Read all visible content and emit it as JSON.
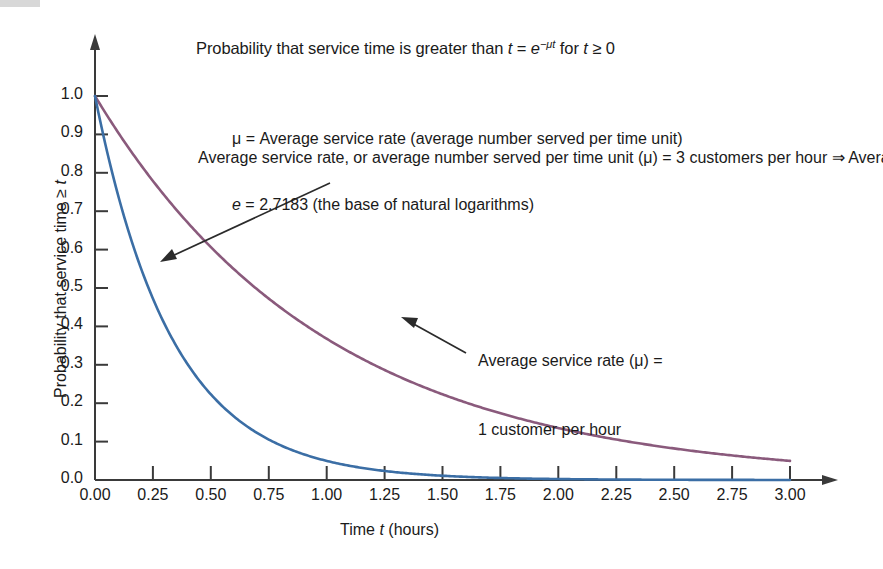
{
  "chart_data": {
    "type": "line",
    "title_parts": {
      "lead": "Probability that service time is greater than ",
      "var_t": "t",
      "equals": " = ",
      "base_e": "e",
      "exponent": "−μt",
      "tail_for": " for ",
      "var_t2": "t",
      "tail_cond": " ≥ 0"
    },
    "xlabel": "Time t (hours)",
    "xlabel_parts": {
      "lead": "Time ",
      "var": "t",
      "tail": " (hours)"
    },
    "ylabel": "Probability that service time ≥ t",
    "ylabel_parts": {
      "lead": "Probability that service time ≥ ",
      "var": "t"
    },
    "xlim": [
      0,
      3
    ],
    "ylim": [
      0,
      1
    ],
    "grid": false,
    "legend": "none",
    "xticks": [
      "0.00",
      "0.25",
      "0.50",
      "0.75",
      "1.00",
      "1.25",
      "1.50",
      "1.75",
      "2.00",
      "2.25",
      "2.50",
      "2.75",
      "3.00"
    ],
    "xtick_values": [
      0,
      0.25,
      0.5,
      0.75,
      1,
      1.25,
      1.5,
      1.75,
      2,
      2.25,
      2.5,
      2.75,
      3
    ],
    "yticks": [
      "0.0",
      "0.1",
      "0.2",
      "0.3",
      "0.4",
      "0.5",
      "0.6",
      "0.7",
      "0.8",
      "0.9",
      "1.0"
    ],
    "ytick_values": [
      0,
      0.1,
      0.2,
      0.3,
      0.4,
      0.5,
      0.6,
      0.7,
      0.8,
      0.9,
      1.0
    ],
    "series": [
      {
        "name": "Average service rate (μ) = 3 customers per hour",
        "mu": 3,
        "color": "#3b6ea5",
        "x": [
          0,
          0.25,
          0.5,
          0.75,
          1,
          1.25,
          1.5,
          1.75,
          2,
          2.25,
          2.5,
          2.75,
          3
        ],
        "values": [
          1.0,
          0.472,
          0.223,
          0.105,
          0.05,
          0.024,
          0.011,
          0.005,
          0.0025,
          0.0012,
          0.00055,
          0.00026,
          0.00012
        ]
      },
      {
        "name": "Average service rate (μ) = 1 customer per hour",
        "mu": 1,
        "color": "#8a5a7c",
        "x": [
          0,
          0.25,
          0.5,
          0.75,
          1,
          1.25,
          1.5,
          1.75,
          2,
          2.25,
          2.5,
          2.75,
          3
        ],
        "values": [
          1.0,
          0.779,
          0.607,
          0.472,
          0.368,
          0.287,
          0.223,
          0.174,
          0.135,
          0.105,
          0.082,
          0.064,
          0.05
        ]
      }
    ],
    "annotations": [
      {
        "id": "definitions",
        "lines": [
          "μ = Average service rate (average number served per time unit)",
          "e = 2.7183 (the base of natural logarithms)"
        ]
      },
      {
        "id": "annotation-mu3",
        "text": "Average service rate, or average number served per time unit (μ) = 3 customers per hour ⇒ Average service time = 20 minutes (or 1/3 hour) per customer",
        "points_to_series": "mu=3"
      },
      {
        "id": "annotation-mu1",
        "text": "Average service rate (μ) = 1 customer per hour",
        "points_to_series": "mu=1"
      }
    ]
  },
  "definitions": {
    "line1_pre": "μ = Average service rate (average number served per time unit)",
    "line2_e": "e",
    "line2_rest": " = 2.7183 (the base of natural logarithms)"
  },
  "annotation_mu3": {
    "text": "Average service rate, or average number served per time unit (μ) = 3 customers per hour ⇒ Average service time = 20 minutes (or 1/3 hour) per customer"
  },
  "annotation_mu1": {
    "line1": "Average service rate (μ) =",
    "line2": "1 customer per hour"
  },
  "colors": {
    "series_mu3": "#3b6ea5",
    "series_mu1": "#8a5a7c",
    "axis": "#3a3a3a",
    "text": "#1a1a1a"
  }
}
